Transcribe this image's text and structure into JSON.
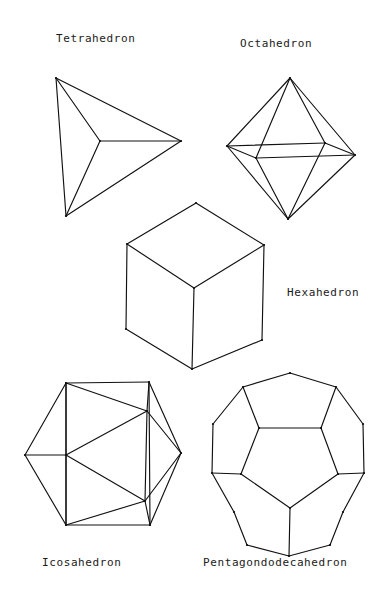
{
  "page": {
    "background_color": "#ffffff",
    "stroke_color": "#111111",
    "width": 389,
    "height": 606
  },
  "labels": {
    "tetrahedron": "Tetrahedron",
    "octahedron": "Octahedron",
    "hexahedron": "Hexahedron",
    "icosahedron": "Icosahedron",
    "pentagondodecahedron": "Pentagondodecahedron"
  },
  "chart_data": {
    "type": "diagram",
    "subtitle": "",
    "legend": [],
    "grid": false,
    "figures": [
      {
        "name": "tetrahedron",
        "label": "Tetrahedron",
        "faces": 4,
        "face_shape": "triangle",
        "vertices_shown": 4,
        "label_position": {
          "x": 56,
          "y": 33
        },
        "points_2d": {
          "apex_top_left": [
            56,
            78
          ],
          "apex_right": [
            181,
            141
          ],
          "apex_bottom": [
            66,
            216
          ],
          "center": [
            100,
            141
          ]
        },
        "edges": [
          [
            "apex_top_left",
            "apex_right"
          ],
          [
            "apex_right",
            "apex_bottom"
          ],
          [
            "apex_bottom",
            "apex_top_left"
          ],
          [
            "center",
            "apex_top_left"
          ],
          [
            "center",
            "apex_right"
          ],
          [
            "center",
            "apex_bottom"
          ]
        ]
      },
      {
        "name": "octahedron",
        "label": "Octahedron",
        "faces": 8,
        "face_shape": "triangle",
        "vertices_shown": 6,
        "label_position": {
          "x": 240,
          "y": 38
        },
        "points_2d": {
          "top": [
            290,
            78
          ],
          "bottom": [
            288,
            219
          ],
          "left": [
            227,
            146
          ],
          "right": [
            355,
            155
          ],
          "front": [
            256,
            158
          ],
          "back": [
            325,
            143
          ]
        },
        "edges": [
          [
            "top",
            "left"
          ],
          [
            "top",
            "right"
          ],
          [
            "top",
            "front"
          ],
          [
            "top",
            "back"
          ],
          [
            "bottom",
            "left"
          ],
          [
            "bottom",
            "right"
          ],
          [
            "bottom",
            "front"
          ],
          [
            "bottom",
            "back"
          ],
          [
            "left",
            "front"
          ],
          [
            "front",
            "right"
          ],
          [
            "right",
            "back"
          ],
          [
            "back",
            "left"
          ]
        ]
      },
      {
        "name": "hexahedron",
        "label": "Hexahedron",
        "faces": 6,
        "face_shape": "square",
        "vertices_shown": 7,
        "label_position": {
          "x": 287,
          "y": 287
        },
        "points_2d": {
          "top": [
            196,
            203
          ],
          "upper_left": [
            127,
            244
          ],
          "upper_right": [
            264,
            245
          ],
          "center": [
            194,
            288
          ],
          "lower_left": [
            126,
            329
          ],
          "lower_right": [
            262,
            340
          ],
          "bottom": [
            192,
            369
          ]
        },
        "edges": [
          [
            "top",
            "upper_left"
          ],
          [
            "top",
            "upper_right"
          ],
          [
            "upper_left",
            "center"
          ],
          [
            "upper_right",
            "center"
          ],
          [
            "upper_left",
            "lower_left"
          ],
          [
            "upper_right",
            "lower_right"
          ],
          [
            "center",
            "bottom"
          ],
          [
            "lower_left",
            "bottom"
          ],
          [
            "lower_right",
            "bottom"
          ]
        ]
      },
      {
        "name": "icosahedron",
        "label": "Icosahedron",
        "faces": 20,
        "face_shape": "triangle",
        "vertices_shown": 9,
        "label_position": {
          "x": 42,
          "y": 557
        },
        "points_2d": {
          "hex_top_left": [
            66,
            383
          ],
          "hex_top_right": [
            149,
            382
          ],
          "hex_right": [
            181,
            453
          ],
          "hex_bottom_right": [
            150,
            525
          ],
          "hex_bottom_left": [
            66,
            525
          ],
          "hex_left": [
            25,
            455
          ],
          "mid_left": [
            66,
            455
          ],
          "inner_upper": [
            147,
            411
          ],
          "inner_lower": [
            145,
            501
          ]
        },
        "edges": [
          [
            "hex_top_left",
            "hex_top_right"
          ],
          [
            "hex_top_right",
            "hex_right"
          ],
          [
            "hex_right",
            "hex_bottom_right"
          ],
          [
            "hex_bottom_right",
            "hex_bottom_left"
          ],
          [
            "hex_bottom_left",
            "hex_left"
          ],
          [
            "hex_left",
            "hex_top_left"
          ],
          [
            "hex_left",
            "mid_left"
          ],
          [
            "mid_left",
            "hex_top_left"
          ],
          [
            "mid_left",
            "hex_bottom_left"
          ],
          [
            "hex_top_left",
            "hex_bottom_left"
          ],
          [
            "mid_left",
            "inner_upper"
          ],
          [
            "mid_left",
            "inner_lower"
          ],
          [
            "hex_top_left",
            "inner_upper"
          ],
          [
            "inner_upper",
            "inner_lower"
          ],
          [
            "inner_lower",
            "hex_bottom_left"
          ],
          [
            "inner_upper",
            "hex_top_right"
          ],
          [
            "inner_upper",
            "hex_right"
          ],
          [
            "inner_lower",
            "hex_right"
          ],
          [
            "inner_lower",
            "hex_bottom_right"
          ],
          [
            "hex_top_right",
            "hex_bottom_right"
          ]
        ]
      },
      {
        "name": "pentagondodecahedron",
        "label": "Pentagondodecahedron",
        "faces": 12,
        "face_shape": "pentagon",
        "vertices_shown": 15,
        "label_position": {
          "x": 203,
          "y": 557
        },
        "points_2d": {
          "o_top": [
            290,
            373
          ],
          "o_upper_right": [
            336,
            387
          ],
          "o_right_upper": [
            363,
            424
          ],
          "o_right": [
            364,
            473
          ],
          "o_lower_right": [
            343,
            512
          ],
          "o_bottom_right": [
            330,
            545
          ],
          "o_bottom": [
            289,
            556
          ],
          "o_bottom_left": [
            247,
            545
          ],
          "o_lower_left": [
            234,
            512
          ],
          "o_left": [
            212,
            473
          ],
          "o_left_upper": [
            213,
            424
          ],
          "o_upper_left": [
            243,
            387
          ],
          "i_upper_left": [
            259,
            428
          ],
          "i_upper_right": [
            321,
            428
          ],
          "i_right": [
            338,
            474
          ],
          "i_bottom": [
            290,
            508
          ],
          "i_left": [
            241,
            474
          ]
        },
        "edges": [
          [
            "o_top",
            "o_upper_right"
          ],
          [
            "o_upper_right",
            "o_right_upper"
          ],
          [
            "o_right_upper",
            "o_right"
          ],
          [
            "o_right",
            "o_lower_right"
          ],
          [
            "o_lower_right",
            "o_bottom_right"
          ],
          [
            "o_bottom_right",
            "o_bottom"
          ],
          [
            "o_bottom",
            "o_bottom_left"
          ],
          [
            "o_bottom_left",
            "o_lower_left"
          ],
          [
            "o_lower_left",
            "o_left"
          ],
          [
            "o_left",
            "o_left_upper"
          ],
          [
            "o_left_upper",
            "o_upper_left"
          ],
          [
            "o_upper_left",
            "o_top"
          ],
          [
            "o_upper_left",
            "i_upper_left"
          ],
          [
            "o_upper_right",
            "i_upper_right"
          ],
          [
            "o_right",
            "i_right"
          ],
          [
            "o_bottom",
            "i_bottom"
          ],
          [
            "o_left",
            "i_left"
          ],
          [
            "i_upper_left",
            "i_upper_right"
          ],
          [
            "i_upper_right",
            "i_right"
          ],
          [
            "i_right",
            "i_bottom"
          ],
          [
            "i_bottom",
            "i_left"
          ],
          [
            "i_left",
            "i_upper_left"
          ]
        ]
      }
    ]
  }
}
